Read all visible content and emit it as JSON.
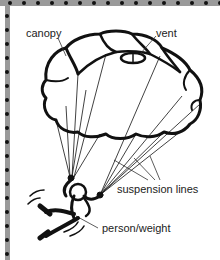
{
  "diagram": {
    "labels": {
      "canopy": "canopy",
      "vent": "vent",
      "suspension_lines": "suspension lines",
      "person_weight": "person/weight"
    },
    "colors": {
      "ink": "#111111",
      "border": "#9a9a9a",
      "background": "#ffffff"
    }
  }
}
